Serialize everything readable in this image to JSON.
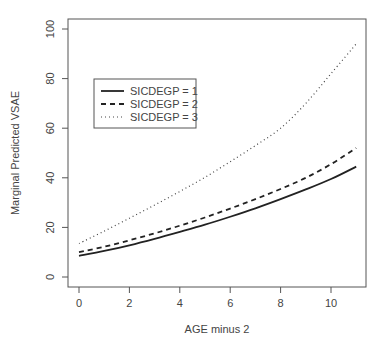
{
  "chart_data": {
    "type": "line",
    "title": "",
    "xlabel": "AGE minus 2",
    "ylabel": "Marginal Predicted VSAE",
    "xlim": [
      -0.4,
      11.4
    ],
    "ylim": [
      -4,
      104
    ],
    "x_ticks": [
      0,
      2,
      4,
      6,
      8,
      10
    ],
    "y_ticks": [
      0,
      20,
      40,
      60,
      80,
      100
    ],
    "grid": false,
    "legend_position": "upper-left (inside)",
    "x": [
      0,
      1,
      2,
      3,
      4,
      5,
      6,
      7,
      8,
      9,
      10,
      11
    ],
    "series": [
      {
        "name": "SICDEGP = 1",
        "style": "solid",
        "values": [
          8.5,
          10.5,
          12.8,
          15.4,
          18.2,
          21.1,
          24.3,
          27.7,
          31.4,
          35.3,
          39.5,
          44.5
        ]
      },
      {
        "name": "SICDEGP = 2",
        "style": "dashed",
        "values": [
          10.0,
          12.2,
          14.8,
          17.6,
          20.7,
          24.0,
          27.6,
          31.4,
          35.5,
          40.0,
          45.5,
          52.0
        ]
      },
      {
        "name": "SICDEGP = 3",
        "style": "dotted",
        "values": [
          13.5,
          18.5,
          23.7,
          29.0,
          34.5,
          40.2,
          46.5,
          53.0,
          60.0,
          70.0,
          82.0,
          94.0
        ]
      }
    ]
  },
  "axis": {
    "xlabel": "AGE minus 2",
    "ylabel": "Marginal Predicted VSAE",
    "x_tick_labels": [
      "0",
      "2",
      "4",
      "6",
      "8",
      "10"
    ],
    "y_tick_labels": [
      "0",
      "20",
      "40",
      "60",
      "80",
      "100"
    ]
  },
  "legend": {
    "items": [
      "SICDEGP = 1",
      "SICDEGP = 2",
      "SICDEGP = 3"
    ]
  }
}
